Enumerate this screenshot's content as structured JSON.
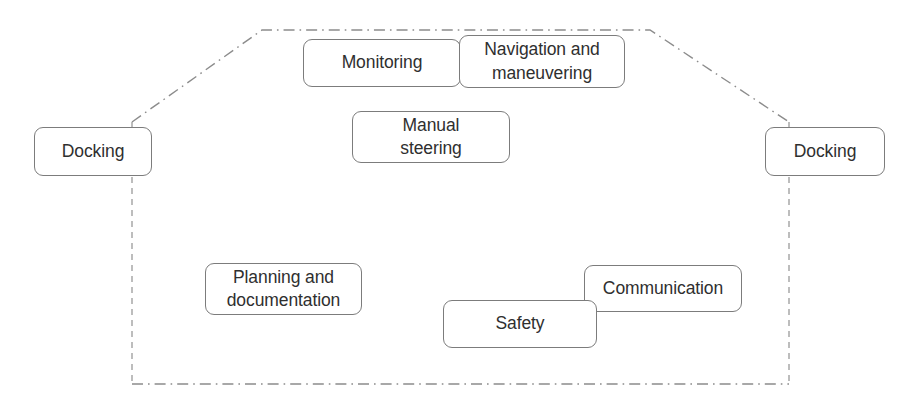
{
  "diagram": {
    "type": "boundary-diagram",
    "boundary": {
      "style": "dash-dot",
      "color": "#8c8c8c",
      "shape": "hexagon",
      "vertices": "132,122 262,30 650,30 789,122 789,384 132,384"
    },
    "boxes": [
      {
        "id": "docking-left",
        "label": "Docking",
        "x": 34,
        "y": 127,
        "w": 118,
        "h": 49,
        "z": 3
      },
      {
        "id": "monitoring",
        "label": "Monitoring",
        "x": 303,
        "y": 39,
        "w": 158,
        "h": 48,
        "z": 3
      },
      {
        "id": "navigation-and-maneuvering",
        "label": "Navigation and\nmaneuvering",
        "x": 459,
        "y": 35,
        "w": 166,
        "h": 53,
        "z": 4
      },
      {
        "id": "manual-steering",
        "label": "Manual\nsteering",
        "x": 352,
        "y": 111,
        "w": 158,
        "h": 52,
        "z": 3
      },
      {
        "id": "docking-right",
        "label": "Docking",
        "x": 765,
        "y": 127,
        "w": 120,
        "h": 49,
        "z": 3
      },
      {
        "id": "planning-and-documentation",
        "label": "Planning and\ndocumentation",
        "x": 205,
        "y": 263,
        "w": 157,
        "h": 52,
        "z": 3
      },
      {
        "id": "communication",
        "label": "Communication",
        "x": 584,
        "y": 265,
        "w": 158,
        "h": 47,
        "z": 3
      },
      {
        "id": "safety",
        "label": "Safety",
        "x": 443,
        "y": 300,
        "w": 154,
        "h": 48,
        "z": 5
      }
    ]
  }
}
